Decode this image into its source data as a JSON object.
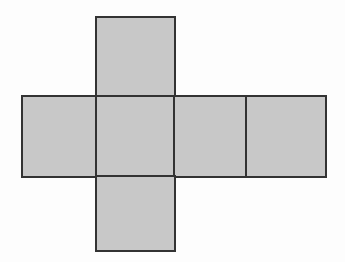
{
  "figure": {
    "title": "",
    "type": "cube-net-diagram",
    "canvas": {
      "width": 345,
      "height": 262
    },
    "colors": {
      "background": "#fdfdfd",
      "face_fill": "#c8c8c8",
      "face_stroke": "#333333",
      "stroke_width": 2
    },
    "faces": [
      {
        "id": "top",
        "label": "",
        "x": 96,
        "y": 17,
        "width": 79,
        "height": 80
      },
      {
        "id": "row-1",
        "label": "",
        "x": 22,
        "y": 96,
        "width": 74,
        "height": 81
      },
      {
        "id": "row-2",
        "label": "",
        "x": 96,
        "y": 96,
        "width": 78,
        "height": 81
      },
      {
        "id": "row-3",
        "label": "",
        "x": 174,
        "y": 96,
        "width": 72,
        "height": 81
      },
      {
        "id": "row-4",
        "label": "",
        "x": 246,
        "y": 96,
        "width": 80,
        "height": 81
      },
      {
        "id": "bottom",
        "label": "",
        "x": 96,
        "y": 176,
        "width": 79,
        "height": 75
      }
    ]
  }
}
